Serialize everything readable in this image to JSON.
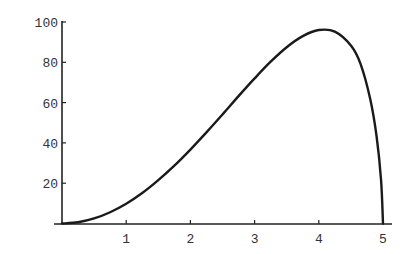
{
  "chart_data": {
    "type": "line",
    "title": "",
    "xlabel": "",
    "ylabel": "",
    "xlim": [
      0,
      5.15
    ],
    "ylim": [
      0,
      100
    ],
    "grid": false,
    "legend": null,
    "x_ticks": [
      1,
      2,
      3,
      4,
      5
    ],
    "y_ticks": [
      20,
      40,
      60,
      80,
      100
    ],
    "x_tick_labels": [
      "1",
      "2",
      "3",
      "4",
      "5"
    ],
    "y_tick_labels": [
      "20",
      "40",
      "60",
      "80",
      "100"
    ],
    "series": [
      {
        "name": "curve",
        "x": [
          0,
          0.25,
          0.5,
          0.75,
          1.0,
          1.25,
          1.5,
          1.75,
          2.0,
          2.25,
          2.5,
          2.75,
          3.0,
          3.25,
          3.5,
          3.75,
          4.0,
          4.25,
          4.5,
          4.65,
          4.8,
          4.9,
          4.97,
          5.0
        ],
        "y": [
          0,
          0.6,
          2.5,
          5.6,
          9.8,
          15.1,
          21.5,
          28.7,
          36.7,
          45.2,
          54.1,
          63.2,
          72.0,
          80.3,
          87.5,
          93.0,
          96.0,
          95.2,
          88.3,
          79.2,
          61.9,
          43.3,
          21.5,
          0
        ]
      }
    ]
  },
  "axes": {
    "color": "#222222",
    "curve_color": "#1a1a1a"
  }
}
